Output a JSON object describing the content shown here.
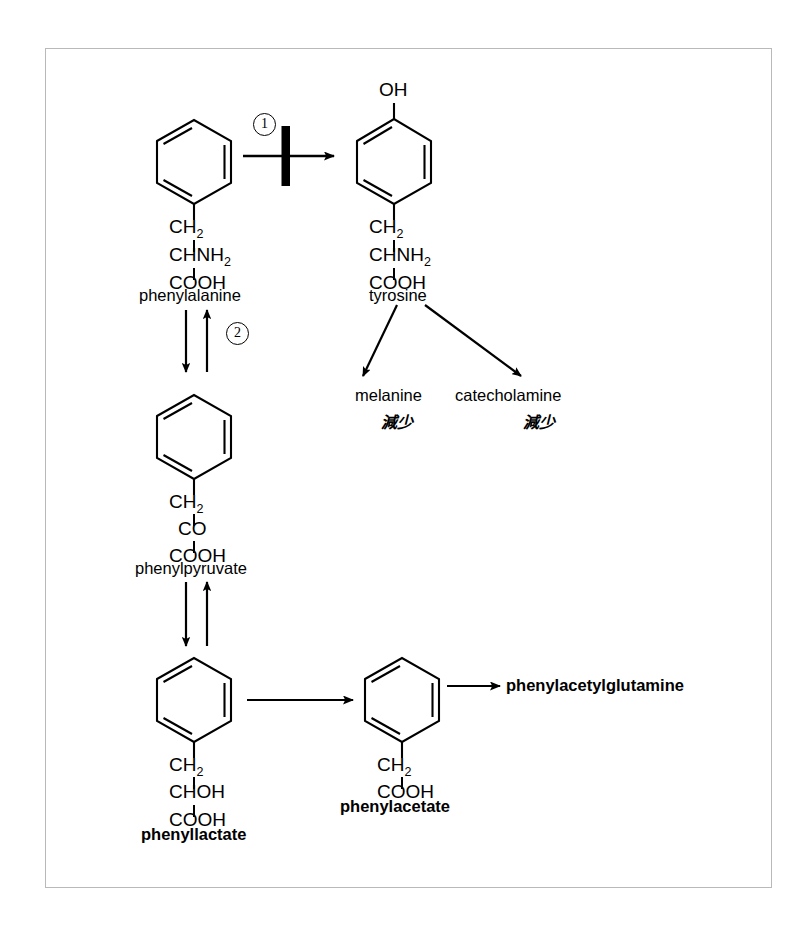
{
  "diagram": {
    "frame_color": "#b9b9b9",
    "stroke_color": "#000000"
  },
  "markers": {
    "step1": "①",
    "step1_plain": "1",
    "step2": "②",
    "step2_plain": "2"
  },
  "nodes": {
    "phenylalanine": {
      "name": "phenylalanine",
      "formula": [
        "CH",
        "2",
        "CHNH",
        "2",
        "COOH"
      ],
      "line1": "CH",
      "line1_sub": "2",
      "line2": "CHNH",
      "line2_sub": "2",
      "line3": "COOH"
    },
    "tyrosine": {
      "name": "tyrosine",
      "hydroxyl": "OH",
      "line1": "CH",
      "line1_sub": "2",
      "line2": "CHNH",
      "line2_sub": "2",
      "line3": "COOH"
    },
    "phenylpyruvate": {
      "name": "phenylpyruvate",
      "line1": "CH",
      "line1_sub": "2",
      "line2": "CO",
      "line3": "COOH"
    },
    "phenyllactate": {
      "name": "phenyllactate",
      "line1": "CH",
      "line1_sub": "2",
      "line2": "CHOH",
      "line3": "COOH"
    },
    "phenylacetate": {
      "name": "phenylacetate",
      "line1": "CH",
      "line1_sub": "2",
      "line2": "COOH"
    },
    "phenylacetylglutamine": {
      "name": "phenylacetylglutamine"
    },
    "melanine": {
      "name": "melanine",
      "annotation": "減少"
    },
    "catecholamine": {
      "name": "catecholamine",
      "annotation": "減少"
    }
  }
}
